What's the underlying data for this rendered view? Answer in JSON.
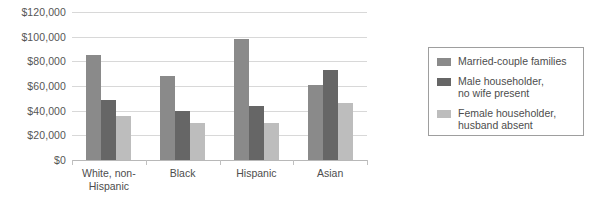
{
  "chart_data": {
    "type": "bar",
    "title": "",
    "subtitle": "",
    "xlabel": "",
    "ylabel": "",
    "grid": "horizontal",
    "legend_position": "right",
    "ylim": [
      0,
      120000
    ],
    "ytick_step": 20000,
    "ytick_labels": [
      "$120,000",
      "$100,000",
      "$80,000",
      "$60,000",
      "$40,000",
      "$20,000",
      "$0"
    ],
    "ytick_values": [
      120000,
      100000,
      80000,
      60000,
      40000,
      20000,
      0
    ],
    "categories": [
      "White, non-\nHispanic",
      "Black",
      "Hispanic",
      "Asian"
    ],
    "series": [
      {
        "name": "Married-couple families",
        "color": "#8a8a8a",
        "values": [
          85000,
          68000,
          98000,
          61000
        ]
      },
      {
        "name": "Male householder,\nno wife present",
        "color": "#666666",
        "values": [
          49000,
          40000,
          44000,
          73000
        ]
      },
      {
        "name": "Female householder,\nhusband absent",
        "color": "#bdbdbd",
        "values": [
          36000,
          30000,
          30000,
          46000
        ]
      }
    ]
  },
  "legend": {
    "items": [
      {
        "label": "Married-couple families",
        "color": "#8a8a8a"
      },
      {
        "label": "Male householder,\nno wife present",
        "color": "#666666"
      },
      {
        "label": "Female householder,\nhusband absent",
        "color": "#bdbdbd"
      }
    ]
  },
  "colors": {
    "gridline": "#d8d8d8",
    "baseline": "#b8b8b8",
    "text": "#4d4d4d",
    "legend_border": "#9e9e9e",
    "background": "#ffffff"
  }
}
